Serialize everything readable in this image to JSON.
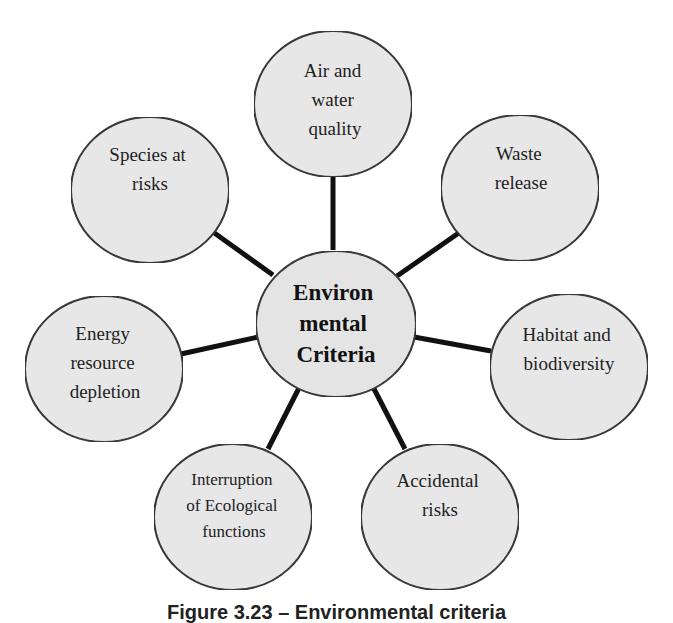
{
  "diagram": {
    "type": "hub-and-spoke",
    "colors": {
      "background": "#ffffff",
      "node_fill": "#e9e9e9",
      "node_stroke": "#1a1a1a",
      "connector": "#111111",
      "text": "#222222"
    },
    "center": {
      "lines": [
        "Environ",
        "mental",
        "Criteria"
      ]
    },
    "nodes": [
      {
        "id": "air-water",
        "lines": [
          "Air and",
          "water",
          "quality"
        ]
      },
      {
        "id": "waste",
        "lines": [
          "Waste",
          "release"
        ]
      },
      {
        "id": "habitat",
        "lines": [
          "Habitat and",
          "biodiversity"
        ]
      },
      {
        "id": "accidental",
        "lines": [
          "Accidental",
          "risks"
        ]
      },
      {
        "id": "ecological",
        "lines": [
          "Interruption",
          "of Ecological",
          "functions"
        ]
      },
      {
        "id": "energy",
        "lines": [
          "Energy",
          "resource",
          "depletion"
        ]
      },
      {
        "id": "species",
        "lines": [
          "Species at",
          "risks"
        ]
      }
    ]
  },
  "caption": {
    "text": "Figure 3.23 – Environmental criteria",
    "legibility": "partially visible, clipped at bottom edge; text not confirmed"
  }
}
